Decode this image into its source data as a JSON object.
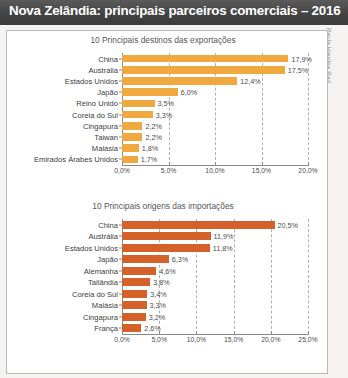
{
  "header": {
    "title": "Nova Zelândia: principais parceiros comerciais – 2016"
  },
  "credit": {
    "text": "Paula Haydee Rad"
  },
  "colors": {
    "header_bg": "#434343",
    "exports_bar": "#F0A940",
    "imports_bar": "#D4602A",
    "grid": "#b0b0b0",
    "axis": "#8a8a8a",
    "frame": "#b9b9b9"
  },
  "chart_data": [
    {
      "id": "exports",
      "type": "bar",
      "orientation": "horizontal",
      "title": "10 Principais destinos das exportações",
      "xlabel": "",
      "ylabel": "",
      "xlim": [
        0,
        20
      ],
      "grid": true,
      "legend": "none",
      "bar_color": "#F0A940",
      "tick_labels": [
        "0,0%",
        "5,0%",
        "10,0%",
        "15,0%",
        "20,0%"
      ],
      "tick_values": [
        0,
        5,
        10,
        15,
        20
      ],
      "categories": [
        "China",
        "Austrália",
        "Estados Unidos",
        "Japão",
        "Reino Unido",
        "Coreia do Sul",
        "Cingapura",
        "Taiwan",
        "Malásia",
        "Emirados Árabes Unidos"
      ],
      "values": [
        17.9,
        17.5,
        12.4,
        6.0,
        3.5,
        3.3,
        2.2,
        2.2,
        1.8,
        1.7
      ],
      "value_labels": [
        "17,9%",
        "17,5%",
        "12,4%",
        "6,0%",
        "3,5%",
        "3,3%",
        "2,2%",
        "2,2%",
        "1,8%",
        "1,7%"
      ]
    },
    {
      "id": "imports",
      "type": "bar",
      "orientation": "horizontal",
      "title": "10 Principais origens das importações",
      "xlabel": "",
      "ylabel": "",
      "xlim": [
        0,
        25
      ],
      "grid": true,
      "legend": "none",
      "bar_color": "#D4602A",
      "tick_labels": [
        "0,0%",
        "5,0%",
        "10,0%",
        "15,0%",
        "20,0%",
        "25,0%"
      ],
      "tick_values": [
        0,
        5,
        10,
        15,
        20,
        25
      ],
      "categories": [
        "China",
        "Austrália",
        "Estados Unidos",
        "Japão",
        "Alemanha",
        "Tailândia",
        "Coreia do Sul",
        "Malásia",
        "Cingapura",
        "França"
      ],
      "values": [
        20.5,
        11.9,
        11.8,
        6.3,
        4.6,
        3.8,
        3.4,
        3.3,
        3.2,
        2.6
      ],
      "value_labels": [
        "20,5%",
        "11,9%",
        "11,8%",
        "6,3%",
        "4,6%",
        "3,8%",
        "3,4%",
        "3,3%",
        "3,2%",
        "2,6%"
      ]
    }
  ]
}
